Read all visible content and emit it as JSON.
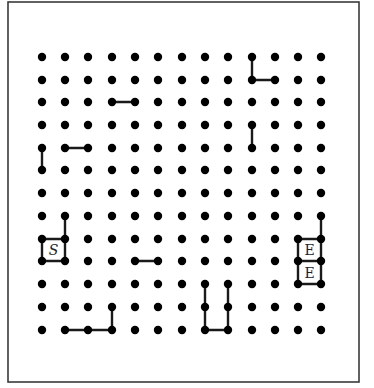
{
  "puzzle": {
    "frame": {
      "x": 8,
      "y": 2,
      "width": 351,
      "height": 380
    },
    "grid": {
      "cols": 13,
      "rows": 13,
      "x_positions": [
        42,
        65,
        88,
        112,
        135,
        158,
        182,
        205,
        228,
        252,
        275,
        298,
        321
      ],
      "y_positions": [
        57,
        80,
        102,
        125,
        148,
        170,
        193,
        216,
        239,
        261,
        284,
        307,
        330
      ],
      "dot_radius": 4.2
    },
    "segments": [
      {
        "from": [
          9,
          0
        ],
        "to": [
          9,
          1
        ]
      },
      {
        "from": [
          9,
          1
        ],
        "to": [
          10,
          1
        ]
      },
      {
        "from": [
          3,
          2
        ],
        "to": [
          4,
          2
        ]
      },
      {
        "from": [
          9,
          3
        ],
        "to": [
          9,
          4
        ]
      },
      {
        "from": [
          0,
          4
        ],
        "to": [
          0,
          5
        ]
      },
      {
        "from": [
          1,
          4
        ],
        "to": [
          2,
          4
        ]
      },
      {
        "from": [
          1,
          7
        ],
        "to": [
          1,
          8
        ]
      },
      {
        "from": [
          0,
          8
        ],
        "to": [
          1,
          8
        ]
      },
      {
        "from": [
          0,
          8
        ],
        "to": [
          0,
          9
        ]
      },
      {
        "from": [
          1,
          8
        ],
        "to": [
          1,
          9
        ]
      },
      {
        "from": [
          0,
          9
        ],
        "to": [
          1,
          9
        ]
      },
      {
        "from": [
          4,
          9
        ],
        "to": [
          5,
          9
        ]
      },
      {
        "from": [
          12,
          7
        ],
        "to": [
          12,
          8
        ]
      },
      {
        "from": [
          11,
          8
        ],
        "to": [
          12,
          8
        ]
      },
      {
        "from": [
          11,
          8
        ],
        "to": [
          11,
          9
        ]
      },
      {
        "from": [
          12,
          8
        ],
        "to": [
          12,
          9
        ]
      },
      {
        "from": [
          11,
          9
        ],
        "to": [
          12,
          9
        ]
      },
      {
        "from": [
          11,
          9
        ],
        "to": [
          11,
          10
        ]
      },
      {
        "from": [
          12,
          9
        ],
        "to": [
          12,
          10
        ]
      },
      {
        "from": [
          11,
          10
        ],
        "to": [
          12,
          10
        ]
      },
      {
        "from": [
          7,
          10
        ],
        "to": [
          7,
          11
        ]
      },
      {
        "from": [
          7,
          11
        ],
        "to": [
          7,
          12
        ]
      },
      {
        "from": [
          8,
          10
        ],
        "to": [
          8,
          11
        ]
      },
      {
        "from": [
          8,
          11
        ],
        "to": [
          8,
          12
        ]
      },
      {
        "from": [
          7,
          12
        ],
        "to": [
          8,
          12
        ]
      },
      {
        "from": [
          3,
          11
        ],
        "to": [
          3,
          12
        ]
      },
      {
        "from": [
          1,
          12
        ],
        "to": [
          2,
          12
        ]
      },
      {
        "from": [
          2,
          12
        ],
        "to": [
          3,
          12
        ]
      }
    ],
    "cell_labels": [
      {
        "text": "S",
        "cell": [
          0,
          8
        ],
        "type": "start"
      },
      {
        "text": "E",
        "cell": [
          11,
          8
        ],
        "type": "end"
      },
      {
        "text": "E",
        "cell": [
          11,
          9
        ],
        "type": "end"
      }
    ]
  }
}
